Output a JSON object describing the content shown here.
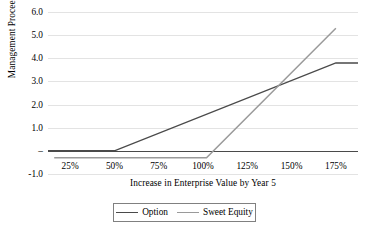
{
  "chart_data": {
    "type": "line",
    "title": "",
    "xlabel": "Increase in Enterprise Value by Year 5",
    "ylabel": "Management Proceeds",
    "xlim": [
      12.5,
      187.5
    ],
    "ylim": [
      -1.0,
      6.0
    ],
    "grid": true,
    "legend_position": "bottom",
    "x_tick_labels": [
      "25%",
      "50%",
      "75%",
      "100%",
      "125%",
      "150%",
      "175%"
    ],
    "x_tick_values": [
      25,
      50,
      75,
      100,
      125,
      150,
      175
    ],
    "y_tick_labels": [
      "6.0",
      "5.0",
      "4.0",
      "3.0",
      "2.0",
      "1.0",
      "–",
      "-1.0"
    ],
    "y_tick_values": [
      6.0,
      5.0,
      4.0,
      3.0,
      2.0,
      1.0,
      0.0,
      -1.0
    ],
    "series": [
      {
        "name": "Option",
        "color": "#4a4a4a",
        "x": [
          12.5,
          50,
          175,
          187.5
        ],
        "values": [
          0.0,
          0.0,
          3.8,
          3.8
        ]
      },
      {
        "name": "Sweet Equity",
        "color": "#9a9a9a",
        "x": [
          16,
          102,
          175
        ],
        "values": [
          -0.3,
          -0.3,
          5.3
        ]
      }
    ],
    "annotations": [
      {
        "label": "crossover",
        "x": 142,
        "y": 3.0
      }
    ]
  },
  "axes": {
    "y_title": "Management Proceeds",
    "x_title": "Increase in Enterprise Value by Year 5"
  },
  "legend": {
    "entries": [
      {
        "label": "Option",
        "color": "#4a4a4a"
      },
      {
        "label": "Sweet Equity",
        "color": "#9a9a9a"
      }
    ]
  }
}
